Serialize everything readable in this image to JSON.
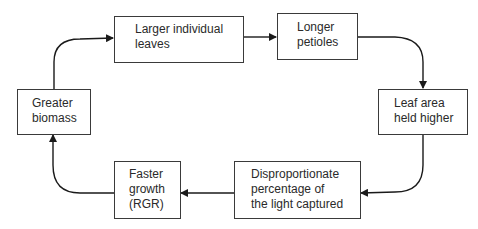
{
  "diagram": {
    "type": "cycle-flowchart",
    "nodes": [
      {
        "id": "larger_leaves",
        "label": "Larger individual\nleaves"
      },
      {
        "id": "longer_petioles",
        "label": "Longer\npetioles"
      },
      {
        "id": "leaf_area_higher",
        "label": "Leaf area\nheld higher"
      },
      {
        "id": "light_captured",
        "label": "Disproportionate\npercentage of\nthe light captured"
      },
      {
        "id": "faster_growth",
        "label": "Faster\ngrowth\n(RGR)"
      },
      {
        "id": "greater_biomass",
        "label": "Greater\nbiomass"
      }
    ],
    "edges": [
      {
        "from": "greater_biomass",
        "to": "larger_leaves"
      },
      {
        "from": "larger_leaves",
        "to": "longer_petioles"
      },
      {
        "from": "longer_petioles",
        "to": "leaf_area_higher"
      },
      {
        "from": "leaf_area_higher",
        "to": "light_captured"
      },
      {
        "from": "light_captured",
        "to": "faster_growth"
      },
      {
        "from": "faster_growth",
        "to": "greater_biomass"
      }
    ],
    "colors": {
      "stroke": "#1a1a1a",
      "box_border": "#3a3a3a",
      "background": "#ffffff",
      "text": "#2a2a2a"
    }
  }
}
